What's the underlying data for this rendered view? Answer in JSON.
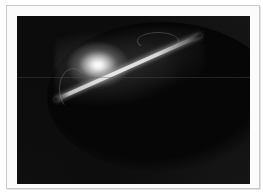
{
  "image": {
    "description": "Dark astronomical-style photograph of a glowing curved arc with a bright luminous spot and faint wispy filaments, shown in a light picture frame",
    "subject": "glowing arc and bright spot on black background",
    "colors": {
      "frame_background": "#fbfbfb",
      "frame_border": "#c9c9c9",
      "photo_background": "#0c0c0c",
      "highlight": "#ffffff",
      "arc": "#e0e0e0"
    }
  }
}
